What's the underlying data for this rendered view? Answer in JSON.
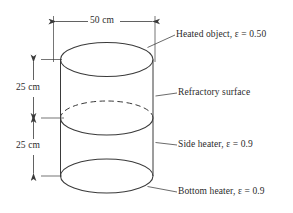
{
  "figure": {
    "type": "engineering-diagram",
    "background_color": "#ffffff",
    "line_color": "#3a3a3a",
    "text_color": "#2b2b2b"
  },
  "dimensions": {
    "diameter": {
      "text": "50 cm",
      "orientation": "horizontal",
      "position": "top"
    },
    "upper_height": {
      "text": "25 cm",
      "orientation": "vertical",
      "position": "left-upper"
    },
    "lower_height": {
      "text": "25 cm",
      "orientation": "vertical",
      "position": "left-lower"
    }
  },
  "labels": {
    "top_surface": "Heated object, ε = 0.50",
    "mid_surface": "Refractory surface",
    "side_surface": "Side heater, ε = 0.9",
    "bottom_surface": "Bottom heater, ε = 0.9"
  }
}
